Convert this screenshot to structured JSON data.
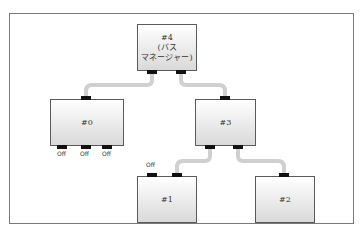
{
  "diagram": {
    "nodes": [
      {
        "id": "4",
        "label": "#4\n(バス\nマネージャー)",
        "line1": "#4",
        "line2": "(バス",
        "line3": "マネージャー)"
      },
      {
        "id": "0",
        "label": "#0"
      },
      {
        "id": "3",
        "label": "#3"
      },
      {
        "id": "1",
        "label": "#1"
      },
      {
        "id": "2",
        "label": "#2"
      }
    ],
    "edges": [
      {
        "from": "4",
        "to": "0"
      },
      {
        "from": "4",
        "to": "3"
      },
      {
        "from": "3",
        "to": "1"
      },
      {
        "from": "3",
        "to": "2"
      }
    ],
    "port_labels": {
      "node0_p1": "Off",
      "node0_p2": "Off",
      "node0_p3": "Off",
      "node1_p1": "Off"
    },
    "colors": {
      "wire": "#d0d0d0",
      "port": "#111111",
      "border": "#5a5a5a"
    }
  },
  "caption": ""
}
